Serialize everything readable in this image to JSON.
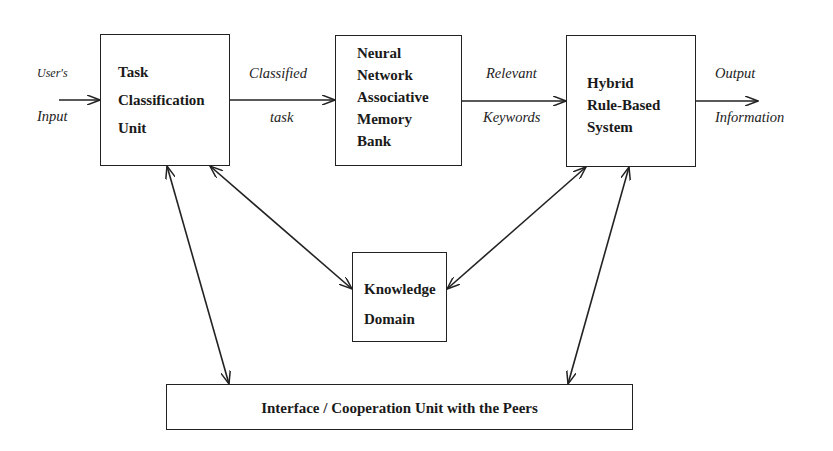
{
  "diagram": {
    "type": "block-diagram",
    "boxes": {
      "task": {
        "lines": [
          "Task",
          "Classification",
          "Unit"
        ]
      },
      "neural": {
        "lines": [
          "Neural",
          "Network",
          "Associative",
          "Memory",
          "Bank"
        ]
      },
      "hybrid": {
        "lines": [
          "Hybrid",
          "Rule-Based",
          "System"
        ]
      },
      "knowledge": {
        "lines": [
          "Knowledge",
          "Domain"
        ]
      },
      "interface": {
        "lines": [
          "Interface / Cooperation Unit with the Peers"
        ]
      }
    },
    "edge_labels": {
      "input_top": "User's",
      "input_bottom": "Input",
      "classified_top": "Classified",
      "classified_bottom": "task",
      "keywords_top": "Relevant",
      "keywords_bottom": "Keywords",
      "output_top": "Output",
      "output_bottom": "Information"
    },
    "edges": [
      {
        "from": "external",
        "to": "task",
        "type": "directed",
        "label": "User's Input"
      },
      {
        "from": "task",
        "to": "neural",
        "type": "directed",
        "label": "Classified task"
      },
      {
        "from": "neural",
        "to": "hybrid",
        "type": "directed",
        "label": "Relevant Keywords"
      },
      {
        "from": "hybrid",
        "to": "external",
        "type": "directed",
        "label": "Output Information"
      },
      {
        "from": "task",
        "to": "knowledge",
        "type": "bidirectional"
      },
      {
        "from": "hybrid",
        "to": "knowledge",
        "type": "bidirectional"
      },
      {
        "from": "task",
        "to": "interface",
        "type": "bidirectional"
      },
      {
        "from": "hybrid",
        "to": "interface",
        "type": "bidirectional"
      }
    ]
  }
}
